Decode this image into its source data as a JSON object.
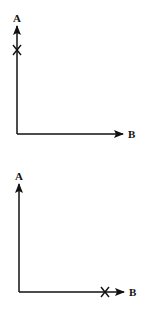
{
  "panels": [
    {
      "id": "top",
      "y_axis_label": "A",
      "x_axis_label": "B",
      "marker": "X",
      "marker_position": "on A axis near top"
    },
    {
      "id": "bottom",
      "y_axis_label": "A",
      "x_axis_label": "B",
      "marker": "X",
      "marker_position": "on B axis near right end"
    }
  ],
  "colors": {
    "stroke": "#111111",
    "background": "#ffffff"
  }
}
